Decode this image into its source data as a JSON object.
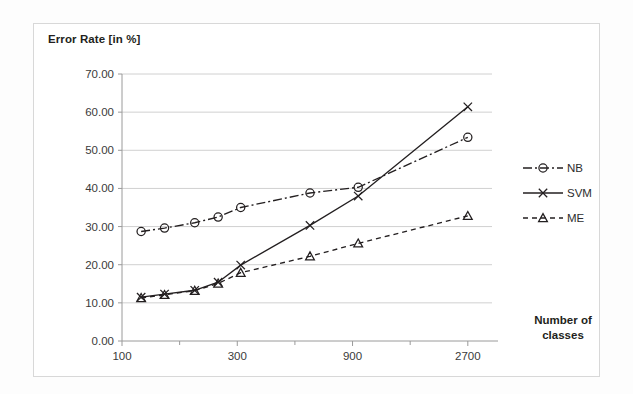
{
  "axis_titles": {
    "y": "Error Rate [in %]",
    "x_line1": "Number of",
    "x_line2": "classes"
  },
  "legend": {
    "position": "right",
    "entries": [
      {
        "label": "NB",
        "style": "dash-dot",
        "marker": "circle"
      },
      {
        "label": "SVM",
        "style": "solid",
        "marker": "cross"
      },
      {
        "label": "ME",
        "style": "dashed",
        "marker": "triangle"
      }
    ]
  },
  "ticks": {
    "y": [
      "0.00",
      "10.00",
      "20.00",
      "30.00",
      "40.00",
      "50.00",
      "60.00",
      "70.00"
    ],
    "x": [
      "100",
      "300",
      "900",
      "2700"
    ]
  },
  "colors": {
    "series": "#231f20",
    "grid": "#d0d0d0",
    "axis": "#9a9a9a",
    "frame": "#d8d8d8",
    "background": "#ffffff"
  },
  "chart_data": {
    "type": "line",
    "title": "",
    "xlabel": "Number of classes",
    "ylabel": "Error Rate [in %]",
    "xscale": "log",
    "xlim": [
      100,
      3400
    ],
    "ylim": [
      0,
      70
    ],
    "ytick_step": 10,
    "grid": true,
    "legend_position": "right",
    "x": [
      120,
      150,
      200,
      250,
      310,
      600,
      950,
      2700
    ],
    "xtick_values": [
      100,
      300,
      900,
      2700
    ],
    "series": [
      {
        "name": "NB",
        "values": [
          28.7,
          29.6,
          31.0,
          32.5,
          35.0,
          38.8,
          40.3,
          53.4
        ]
      },
      {
        "name": "SVM",
        "values": [
          11.5,
          12.3,
          13.3,
          15.4,
          19.9,
          30.3,
          38.0,
          61.4
        ]
      },
      {
        "name": "ME",
        "values": [
          11.3,
          12.1,
          13.2,
          15.1,
          17.9,
          22.2,
          25.6,
          32.8
        ]
      }
    ]
  }
}
